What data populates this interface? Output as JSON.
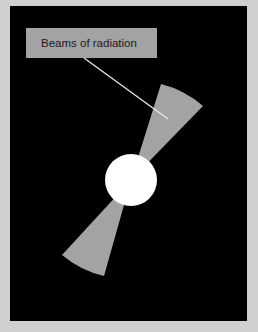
{
  "diagram": {
    "label": "Beams of radiation",
    "colors": {
      "page_background": "#d0d0d0",
      "frame_background": "#000000",
      "beam": "#a3a3a3",
      "label_box": "#a3a3a3",
      "star": "#ffffff",
      "leader_line": "#e8e8e8",
      "label_text": "#1a1a1a"
    },
    "elements": [
      {
        "type": "star",
        "shape": "circle",
        "center": [
          131,
          180
        ],
        "radius": 26
      },
      {
        "type": "beam",
        "direction": "upper-right"
      },
      {
        "type": "beam",
        "direction": "lower-left"
      },
      {
        "type": "label",
        "text": "Beams of radiation",
        "points_to": "upper-right beam"
      }
    ]
  }
}
